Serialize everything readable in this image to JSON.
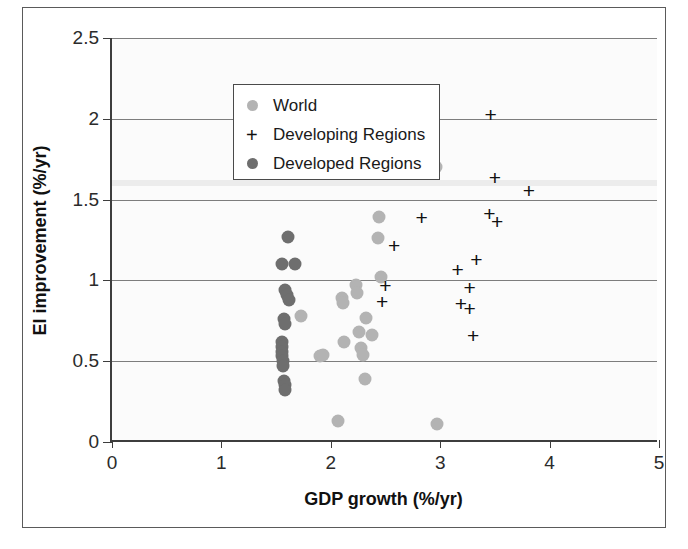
{
  "figure": {
    "background_color": "#ffffff",
    "frame_color": "#5a5a5a"
  },
  "axes": {
    "x_title": "GDP growth (%/yr)",
    "y_title": "EI improvement (%/yr)",
    "x_ticks": [
      "0",
      "1",
      "2",
      "3",
      "4",
      "5"
    ],
    "y_ticks": [
      "0",
      "0.5",
      "1",
      "1.5",
      "2",
      "2.5"
    ]
  },
  "legend": {
    "items": [
      {
        "label": "World",
        "marker": "circle",
        "color": "#b3b3b3"
      },
      {
        "label": "Developing Regions",
        "marker": "plus",
        "color": "#111111"
      },
      {
        "label": "Developed Regions",
        "marker": "circle",
        "color": "#6e6e6e"
      }
    ]
  },
  "chart_data": {
    "type": "scatter",
    "title": "",
    "xlabel": "GDP growth (%/yr)",
    "ylabel": "EI improvement (%/yr)",
    "xlim": [
      0,
      5
    ],
    "ylim": [
      0,
      2.5
    ],
    "xticks": [
      0,
      1,
      2,
      3,
      4,
      5
    ],
    "yticks": [
      0,
      0.5,
      1,
      1.5,
      2,
      2.5
    ],
    "grid": "horizontal",
    "legend_position": "top-left inside",
    "series": [
      {
        "name": "World",
        "marker": "circle",
        "color": "#b3b3b3",
        "points": [
          [
            1.73,
            0.78
          ],
          [
            1.9,
            0.53
          ],
          [
            1.93,
            0.54
          ],
          [
            2.1,
            0.89
          ],
          [
            2.11,
            0.86
          ],
          [
            2.12,
            0.62
          ],
          [
            2.23,
            0.97
          ],
          [
            2.24,
            0.92
          ],
          [
            2.26,
            0.68
          ],
          [
            2.28,
            0.58
          ],
          [
            2.29,
            0.54
          ],
          [
            2.32,
            0.77
          ],
          [
            2.38,
            0.66
          ],
          [
            2.43,
            1.26
          ],
          [
            2.44,
            1.39
          ],
          [
            2.46,
            1.02
          ],
          [
            2.31,
            0.39
          ],
          [
            2.07,
            0.13
          ],
          [
            2.97,
            0.11
          ],
          [
            2.96,
            1.7
          ]
        ]
      },
      {
        "name": "Developing Regions",
        "marker": "plus",
        "color": "#111111",
        "points": [
          [
            2.92,
            2.08
          ],
          [
            3.46,
            2.03
          ],
          [
            3.5,
            1.64
          ],
          [
            3.81,
            1.56
          ],
          [
            3.45,
            1.42
          ],
          [
            3.52,
            1.37
          ],
          [
            2.83,
            1.39
          ],
          [
            2.58,
            1.22
          ],
          [
            3.33,
            1.13
          ],
          [
            3.16,
            1.07
          ],
          [
            2.5,
            0.97
          ],
          [
            3.27,
            0.96
          ],
          [
            2.47,
            0.87
          ],
          [
            3.19,
            0.86
          ],
          [
            3.27,
            0.83
          ],
          [
            3.3,
            0.66
          ]
        ]
      },
      {
        "name": "Developed Regions",
        "marker": "circle",
        "color": "#6e6e6e",
        "points": [
          [
            1.61,
            1.27
          ],
          [
            1.55,
            1.1
          ],
          [
            1.67,
            1.1
          ],
          [
            1.58,
            0.94
          ],
          [
            1.6,
            0.91
          ],
          [
            1.62,
            0.88
          ],
          [
            1.57,
            0.76
          ],
          [
            1.58,
            0.73
          ],
          [
            1.55,
            0.62
          ],
          [
            1.55,
            0.59
          ],
          [
            1.55,
            0.56
          ],
          [
            1.55,
            0.53
          ],
          [
            1.56,
            0.5
          ],
          [
            1.56,
            0.47
          ],
          [
            1.57,
            0.38
          ],
          [
            1.58,
            0.35
          ],
          [
            1.58,
            0.32
          ]
        ]
      }
    ]
  }
}
